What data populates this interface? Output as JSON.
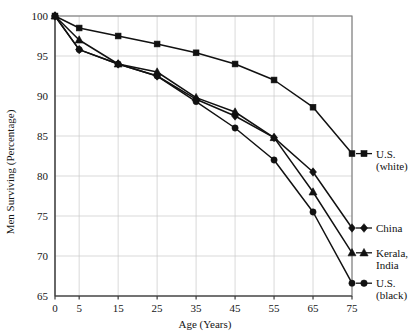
{
  "chart_data": {
    "type": "line",
    "title": "",
    "xlabel": "Age (Years)",
    "ylabel": "Men Surviving (Percentage)",
    "x": [
      0,
      5,
      15,
      25,
      35,
      45,
      55,
      65,
      75
    ],
    "xtick_labels": [
      "0",
      "5",
      "15",
      "25",
      "35",
      "45",
      "55",
      "65",
      "75"
    ],
    "ytick_labels": [
      "65",
      "70",
      "75",
      "80",
      "85",
      "90",
      "95",
      "100"
    ],
    "ylim": [
      65,
      100
    ],
    "ystep": 5,
    "grid": true,
    "legend_position": "right-outside",
    "series": [
      {
        "name": "U.S. (white)",
        "marker": "square",
        "legend_label_line1": "U.S.",
        "legend_label_line2": "(white)",
        "values": [
          100,
          98.5,
          97.5,
          96.5,
          95.4,
          94.0,
          92.0,
          88.6,
          82.8
        ]
      },
      {
        "name": "China",
        "marker": "diamond",
        "legend_label_line1": "China",
        "legend_label_line2": "",
        "values": [
          100,
          95.8,
          94.0,
          92.5,
          89.6,
          87.5,
          84.8,
          80.5,
          73.5
        ]
      },
      {
        "name": "Kerala, India",
        "marker": "triangle",
        "legend_label_line1": "Kerala,",
        "legend_label_line2": "India",
        "values": [
          100,
          97.0,
          94.0,
          93.0,
          89.8,
          88.0,
          84.8,
          78.0,
          70.4
        ]
      },
      {
        "name": "U.S. (black)",
        "marker": "circle",
        "legend_label_line1": "U.S.",
        "legend_label_line2": "(black)",
        "values": [
          100,
          95.8,
          94.0,
          92.5,
          89.3,
          86.0,
          82.0,
          75.5,
          66.6
        ]
      }
    ],
    "colors": {
      "series": "#111111",
      "grid": "#c9c9c9",
      "frame": "#7a7a7a",
      "text": "#151515",
      "background": "#ffffff"
    }
  }
}
